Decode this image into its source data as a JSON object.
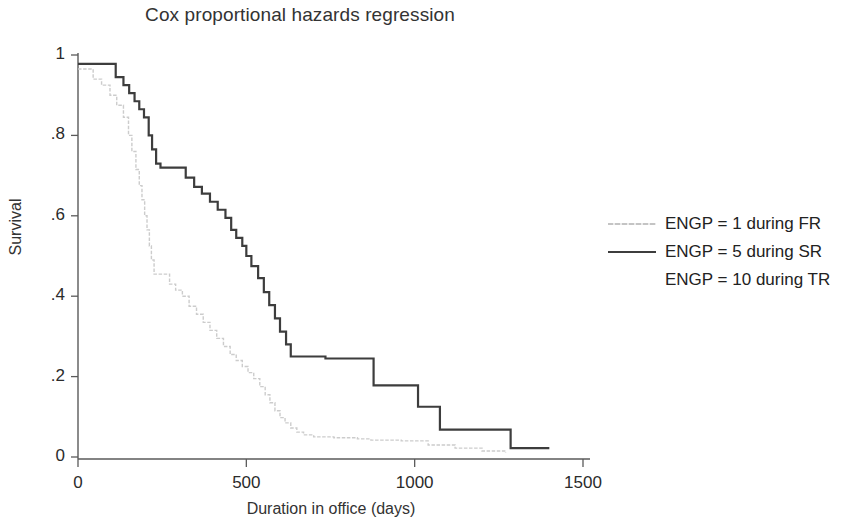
{
  "chart_data": {
    "type": "line",
    "title": "Cox proportional hazards regression",
    "xlabel": "Duration in office (days)",
    "ylabel": "Survival",
    "xlim": [
      0,
      1500
    ],
    "ylim": [
      0,
      1
    ],
    "xticks": [
      0,
      500,
      1000,
      1500
    ],
    "xticklabels": [
      "0",
      "500",
      "1000",
      "1500"
    ],
    "yticks": [
      0,
      0.2,
      0.4,
      0.6,
      0.8,
      1
    ],
    "yticklabels": [
      "0",
      ".2",
      ".4",
      ".6",
      ".8",
      "1"
    ],
    "grid": false,
    "legend_position": "right",
    "style": "step",
    "series": [
      {
        "name": "ENGP = 1 during FR",
        "color": "#c9c9c9",
        "linestyle": "faint",
        "linewidth": 1.4,
        "points": [
          [
            0,
            0.965
          ],
          [
            25,
            0.965
          ],
          [
            45,
            0.94
          ],
          [
            70,
            0.925
          ],
          [
            95,
            0.9
          ],
          [
            115,
            0.875
          ],
          [
            135,
            0.845
          ],
          [
            150,
            0.8
          ],
          [
            160,
            0.76
          ],
          [
            172,
            0.715
          ],
          [
            182,
            0.675
          ],
          [
            190,
            0.64
          ],
          [
            198,
            0.6
          ],
          [
            205,
            0.565
          ],
          [
            212,
            0.525
          ],
          [
            218,
            0.49
          ],
          [
            226,
            0.455
          ],
          [
            258,
            0.455
          ],
          [
            272,
            0.43
          ],
          [
            290,
            0.415
          ],
          [
            310,
            0.4
          ],
          [
            330,
            0.375
          ],
          [
            352,
            0.355
          ],
          [
            372,
            0.335
          ],
          [
            392,
            0.315
          ],
          [
            412,
            0.295
          ],
          [
            432,
            0.275
          ],
          [
            452,
            0.255
          ],
          [
            470,
            0.24
          ],
          [
            488,
            0.225
          ],
          [
            505,
            0.21
          ],
          [
            522,
            0.195
          ],
          [
            540,
            0.175
          ],
          [
            556,
            0.155
          ],
          [
            570,
            0.135
          ],
          [
            585,
            0.115
          ],
          [
            600,
            0.098
          ],
          [
            615,
            0.085
          ],
          [
            632,
            0.072
          ],
          [
            650,
            0.062
          ],
          [
            670,
            0.055
          ],
          [
            700,
            0.05
          ],
          [
            760,
            0.048
          ],
          [
            830,
            0.045
          ],
          [
            870,
            0.042
          ],
          [
            960,
            0.04
          ],
          [
            1040,
            0.03
          ],
          [
            1120,
            0.022
          ],
          [
            1200,
            0.015
          ],
          [
            1270,
            0.01
          ]
        ]
      },
      {
        "name": "ENGP = 5 during SR",
        "color": "#3d3d3d",
        "linestyle": "solid",
        "linewidth": 2.2,
        "points": [
          [
            0,
            0.978
          ],
          [
            95,
            0.978
          ],
          [
            112,
            0.945
          ],
          [
            135,
            0.925
          ],
          [
            152,
            0.905
          ],
          [
            168,
            0.885
          ],
          [
            182,
            0.865
          ],
          [
            196,
            0.845
          ],
          [
            210,
            0.8
          ],
          [
            220,
            0.765
          ],
          [
            232,
            0.73
          ],
          [
            245,
            0.72
          ],
          [
            300,
            0.72
          ],
          [
            320,
            0.695
          ],
          [
            345,
            0.672
          ],
          [
            368,
            0.655
          ],
          [
            392,
            0.635
          ],
          [
            415,
            0.615
          ],
          [
            438,
            0.595
          ],
          [
            455,
            0.565
          ],
          [
            470,
            0.545
          ],
          [
            488,
            0.525
          ],
          [
            500,
            0.5
          ],
          [
            515,
            0.475
          ],
          [
            535,
            0.445
          ],
          [
            552,
            0.41
          ],
          [
            568,
            0.378
          ],
          [
            585,
            0.345
          ],
          [
            600,
            0.312
          ],
          [
            618,
            0.28
          ],
          [
            632,
            0.25
          ],
          [
            700,
            0.25
          ],
          [
            735,
            0.245
          ],
          [
            860,
            0.245
          ],
          [
            878,
            0.178
          ],
          [
            990,
            0.178
          ],
          [
            1010,
            0.125
          ],
          [
            1055,
            0.125
          ],
          [
            1075,
            0.068
          ],
          [
            1265,
            0.068
          ],
          [
            1285,
            0.022
          ],
          [
            1400,
            0.022
          ]
        ]
      },
      {
        "name": "ENGP = 10 during TR",
        "color": "#b8b8b8",
        "linestyle": "none",
        "linewidth": 0,
        "points": []
      }
    ]
  },
  "title": {
    "text": "Cox proportional hazards regression"
  },
  "axes": {
    "ylabel": "Survival",
    "xlabel": "Duration in office (days)",
    "ytick_labels": [
      "1",
      ".8",
      ".6",
      ".4",
      ".2",
      "0"
    ],
    "xtick_labels": [
      "0",
      "500",
      "1000",
      "1500"
    ]
  },
  "legend": {
    "entries": [
      {
        "label": "ENGP = 1 during FR",
        "key": "faint-gray"
      },
      {
        "label": "ENGP = 5 during SR",
        "key": "solid-dark"
      },
      {
        "label": "ENGP = 10 during TR",
        "key": "blank"
      }
    ]
  }
}
